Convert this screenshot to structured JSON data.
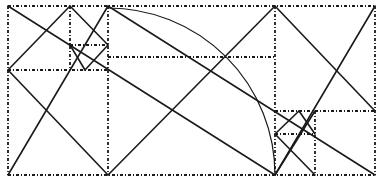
{
  "diagram": {
    "type": "geometric-construction",
    "colors": {
      "ink": "#1a1a1a",
      "background": "#ffffff"
    },
    "frame": {
      "x1": 8,
      "y1": 6,
      "x2": 375,
      "y2": 175
    },
    "dotted_lines": [
      [
        8,
        6,
        375,
        6
      ],
      [
        8,
        175,
        375,
        175
      ],
      [
        8,
        6,
        8,
        175
      ],
      [
        375,
        6,
        375,
        175
      ],
      [
        108,
        6,
        108,
        175
      ],
      [
        275,
        6,
        275,
        175
      ],
      [
        8,
        70,
        108,
        70
      ],
      [
        108,
        57,
        275,
        57
      ],
      [
        70,
        6,
        70,
        70
      ],
      [
        70,
        45,
        108,
        45
      ],
      [
        275,
        111,
        375,
        111
      ],
      [
        315,
        111,
        315,
        175
      ],
      [
        275,
        134,
        315,
        134
      ]
    ],
    "solid_lines": [
      [
        8,
        6,
        275,
        175
      ],
      [
        8,
        175,
        108,
        6
      ],
      [
        108,
        6,
        375,
        175
      ],
      [
        108,
        175,
        275,
        6
      ],
      [
        275,
        6,
        375,
        111
      ],
      [
        275,
        175,
        375,
        6
      ],
      [
        8,
        70,
        70,
        6
      ],
      [
        8,
        70,
        108,
        175
      ],
      [
        70,
        6,
        108,
        45
      ],
      [
        108,
        45,
        85,
        70
      ],
      [
        85,
        70,
        70,
        45
      ],
      [
        275,
        134,
        299,
        111
      ],
      [
        299,
        111,
        315,
        134
      ],
      [
        275,
        134,
        315,
        175
      ],
      [
        315,
        111,
        275,
        175
      ]
    ],
    "arcs": [
      {
        "cx": 108,
        "cy": 175,
        "r": 167,
        "from": [
          108,
          8
        ],
        "to": [
          275,
          175
        ]
      }
    ]
  }
}
